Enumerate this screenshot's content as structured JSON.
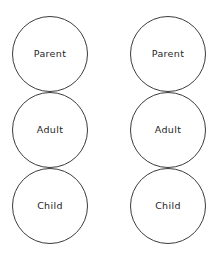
{
  "page": {
    "background_color": "#ffffff",
    "width": 218,
    "height": 255
  },
  "style": {
    "stroke_color": "#3b3b3b",
    "text_color": "#262626",
    "fill_color": "none",
    "stroke_width": 1
  },
  "columns": [
    {
      "id": "left",
      "name": "left-ego-state-stack",
      "circles": [
        {
          "label": "Parent",
          "name": "parent"
        },
        {
          "label": "Adult",
          "name": "adult"
        },
        {
          "label": "Child",
          "name": "child"
        }
      ]
    },
    {
      "id": "right",
      "name": "right-ego-state-stack",
      "circles": [
        {
          "label": "Parent",
          "name": "parent"
        },
        {
          "label": "Adult",
          "name": "adult"
        },
        {
          "label": "Child",
          "name": "child"
        }
      ]
    }
  ]
}
